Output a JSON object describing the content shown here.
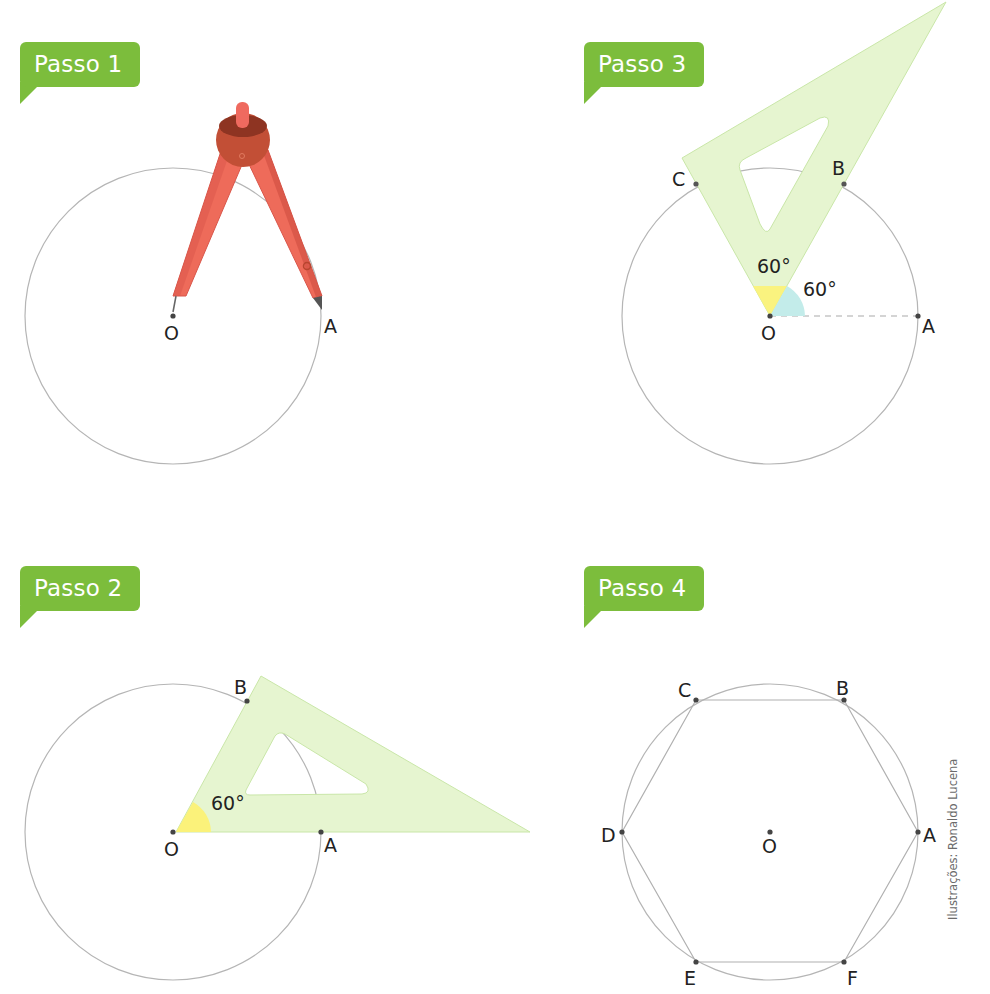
{
  "steps": [
    {
      "label": "Passo 1",
      "tool": "compass",
      "points": {
        "O": "O",
        "A": "A"
      }
    },
    {
      "label": "Passo 2",
      "tool": "set-square",
      "angle": "60°",
      "points": {
        "O": "O",
        "A": "A",
        "B": "B"
      }
    },
    {
      "label": "Passo 3",
      "tool": "set-square",
      "angles": [
        "60°",
        "60°"
      ],
      "points": {
        "O": "O",
        "A": "A",
        "B": "B",
        "C": "C"
      }
    },
    {
      "label": "Passo 4",
      "shape": "regular-hexagon",
      "points": {
        "O": "O",
        "A": "A",
        "B": "B",
        "C": "C",
        "D": "D",
        "E": "E",
        "F": "F"
      }
    }
  ],
  "credit": "Ilustrações: Ronaldo Lucena",
  "colors": {
    "badge": "#7cbd3c",
    "set_square": "#e6f5d0",
    "angle_yellow": "#fbf27a",
    "angle_cyan": "#c3ecea",
    "compass_leg": "#ee6b5a",
    "compass_head": "#b8452f",
    "circle": "#b5b5b5"
  }
}
